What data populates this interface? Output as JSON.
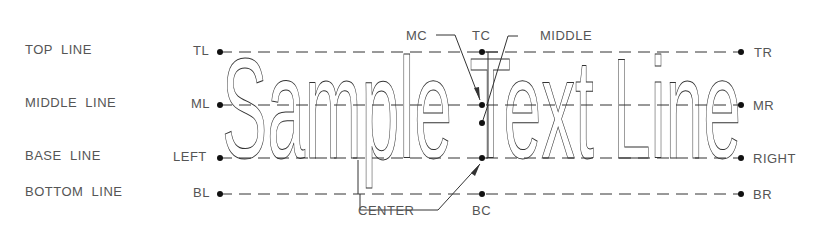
{
  "diagram": {
    "row_labels": [
      "TOP  LINE",
      "MIDDLE  LINE",
      "BASE  LINE",
      "BOTTOM  LINE"
    ],
    "sample_text": "Sample Text Line",
    "left_points": [
      "TL",
      "ML",
      "LEFT",
      "BL"
    ],
    "right_points": [
      "TR",
      "MR",
      "RIGHT",
      "BR"
    ],
    "center_labels": {
      "mc": "MC",
      "tc": "TC",
      "middle": "MIDDLE",
      "center": "CENTER",
      "bc": "BC"
    },
    "colors": {
      "line": "#333333",
      "text": "#555555",
      "dot": "#111111"
    }
  }
}
